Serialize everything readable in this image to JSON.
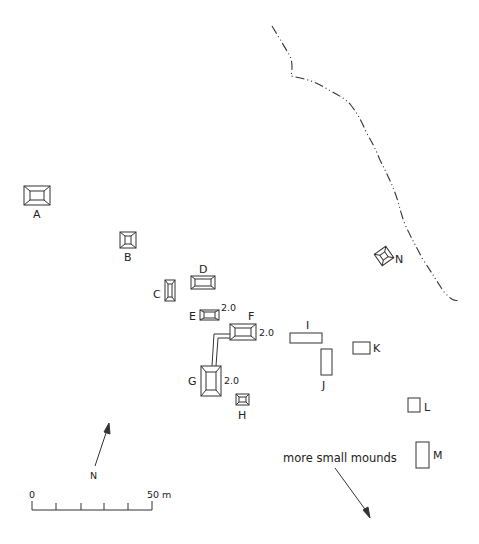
{
  "map": {
    "type": "archaeological site plan",
    "mounds": [
      {
        "id": "A",
        "label": "A",
        "style": "pyramid"
      },
      {
        "id": "B",
        "label": "B",
        "style": "pyramid"
      },
      {
        "id": "C",
        "label": "C",
        "style": "pyramid"
      },
      {
        "id": "D",
        "label": "D",
        "style": "pyramid"
      },
      {
        "id": "E",
        "label": "E",
        "style": "pyramid",
        "height": "2.0"
      },
      {
        "id": "F",
        "label": "F",
        "style": "pyramid",
        "height": "2.0"
      },
      {
        "id": "G",
        "label": "G",
        "style": "pyramid",
        "height": "2.0"
      },
      {
        "id": "H",
        "label": "H",
        "style": "pyramid"
      },
      {
        "id": "I",
        "label": "I",
        "style": "outline"
      },
      {
        "id": "J",
        "label": "J",
        "style": "outline"
      },
      {
        "id": "K",
        "label": "K",
        "style": "outline"
      },
      {
        "id": "L",
        "label": "L",
        "style": "outline"
      },
      {
        "id": "M",
        "label": "M",
        "style": "outline"
      },
      {
        "id": "N",
        "label": "N",
        "style": "pyramid-rotated"
      }
    ],
    "north_arrow": {
      "label": "N"
    },
    "scale_bar": {
      "start_label": "0",
      "end_label": "50 m",
      "ticks": 6
    },
    "annotation": {
      "text": "more small mounds"
    },
    "boundary_line": {
      "style": "dash-dot"
    }
  }
}
